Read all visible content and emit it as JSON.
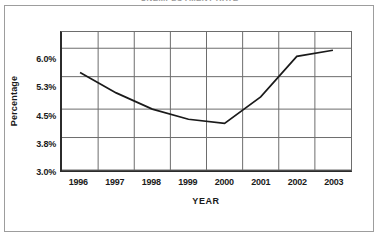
{
  "figure": {
    "title": "UNEMPLOYMENT RATE",
    "background_color": "#ffffff",
    "frame_color": "#9d9d9d",
    "axis_color": "#2b2b2b",
    "grid_color": "#6d6d6d",
    "line_color": "#1a1a1a"
  },
  "chart_data": {
    "type": "line",
    "title": "UNEMPLOYMENT RATE",
    "xlabel": "YEAR",
    "ylabel": "Percentage",
    "categories": [
      "1996",
      "1997",
      "1998",
      "1999",
      "2000",
      "2001",
      "2002",
      "2003"
    ],
    "x": [
      1996,
      1997,
      1998,
      1999,
      2000,
      2001,
      2002,
      2003
    ],
    "values": [
      5.4,
      4.9,
      4.5,
      4.25,
      4.15,
      4.8,
      5.8,
      5.95
    ],
    "series": [
      {
        "name": "Unemployment Rate",
        "values": [
          5.4,
          4.9,
          4.5,
          4.25,
          4.15,
          4.8,
          5.8,
          5.95
        ]
      }
    ],
    "ylim": [
      3.0,
      6.4
    ],
    "yticks": [
      3.0,
      3.8,
      4.5,
      5.3,
      6.0
    ],
    "ytick_labels": [
      "3.0%",
      "3.8%",
      "4.5%",
      "5.3%",
      "6.0%"
    ],
    "xtick_labels": [
      "1996",
      "1997",
      "1998",
      "1999",
      "2000",
      "2001",
      "2002",
      "2003"
    ],
    "grid": true,
    "legend": false,
    "markers": false
  }
}
